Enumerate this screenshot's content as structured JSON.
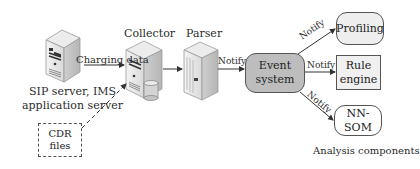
{
  "diagram": {
    "nodes": {
      "sip_server": {
        "label": "SIP server, IMS application server",
        "label_line1": "SIP server, IMS",
        "label_line2": "application server"
      },
      "collector": {
        "label": "Collector"
      },
      "parser": {
        "label": "Parser"
      },
      "event_system": {
        "label": "Event system",
        "fill": "#bdbdbd"
      },
      "profiling": {
        "label": "Profiling",
        "fill": "#eeeeee"
      },
      "rule_engine": {
        "label": "Rule engine",
        "label_line1": "Rule",
        "label_line2": "engine"
      },
      "nn_som": {
        "label": "NN-SOM"
      },
      "cdr_files": {
        "label": "CDR files"
      }
    },
    "edges": [
      {
        "from": "sip_server",
        "to": "collector",
        "label": "Charging data",
        "style": "solid"
      },
      {
        "from": "cdr_files",
        "to": "collector",
        "label": "",
        "style": "dashed"
      },
      {
        "from": "collector",
        "to": "parser",
        "label": "",
        "style": "solid"
      },
      {
        "from": "parser",
        "to": "event_system",
        "label": "Notify",
        "style": "solid"
      },
      {
        "from": "event_system",
        "to": "profiling",
        "label": "Notify",
        "style": "solid"
      },
      {
        "from": "event_system",
        "to": "rule_engine",
        "label": "Notify",
        "style": "solid"
      },
      {
        "from": "event_system",
        "to": "nn_som",
        "label": "Notify",
        "style": "solid"
      }
    ],
    "group_label": "Analysis components"
  }
}
